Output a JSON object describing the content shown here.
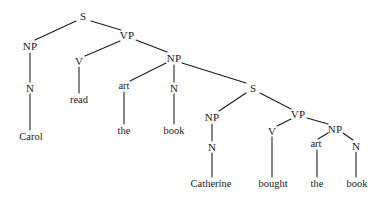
{
  "figure": {
    "kind": "syntax-tree-diagram",
    "sentence": "Carol read the book Catherine bought the book",
    "background_color": "#ffffff",
    "line_color": "#1a1a1a",
    "text_color": "#1a1a1a"
  },
  "nodes": [
    {
      "id": "s-top",
      "label": "S",
      "x": 83,
      "y": 16,
      "kind": "category"
    },
    {
      "id": "np-subj",
      "label": "NP",
      "x": 30,
      "y": 46,
      "kind": "category"
    },
    {
      "id": "n-subj",
      "label": "N",
      "x": 30,
      "y": 88,
      "kind": "category"
    },
    {
      "id": "leaf-carol",
      "label": "Carol",
      "x": 31,
      "y": 137,
      "kind": "leaf"
    },
    {
      "id": "vp-main",
      "label": "VP",
      "x": 127,
      "y": 35,
      "kind": "category"
    },
    {
      "id": "v-main",
      "label": "V",
      "x": 79,
      "y": 61,
      "kind": "category"
    },
    {
      "id": "leaf-read",
      "label": "read",
      "x": 79,
      "y": 100,
      "kind": "leaf"
    },
    {
      "id": "np-obj",
      "label": "NP",
      "x": 174,
      "y": 58,
      "kind": "category"
    },
    {
      "id": "art-obj",
      "label": "art",
      "x": 124,
      "y": 86,
      "kind": "terminal"
    },
    {
      "id": "leaf-the-1",
      "label": "the",
      "x": 124,
      "y": 131,
      "kind": "leaf"
    },
    {
      "id": "n-obj",
      "label": "N",
      "x": 174,
      "y": 88,
      "kind": "category"
    },
    {
      "id": "leaf-book-1",
      "label": "book",
      "x": 174,
      "y": 131,
      "kind": "leaf"
    },
    {
      "id": "s-rel",
      "label": "S",
      "x": 253,
      "y": 88,
      "kind": "category"
    },
    {
      "id": "np-rel-subj",
      "label": "NP",
      "x": 212,
      "y": 117,
      "kind": "category"
    },
    {
      "id": "n-rel-subj",
      "label": "N",
      "x": 212,
      "y": 147,
      "kind": "category"
    },
    {
      "id": "leaf-cath",
      "label": "Catherine",
      "x": 211,
      "y": 184,
      "kind": "leaf"
    },
    {
      "id": "vp-rel",
      "label": "VP",
      "x": 298,
      "y": 114,
      "kind": "category"
    },
    {
      "id": "v-rel",
      "label": "V",
      "x": 272,
      "y": 131,
      "kind": "category"
    },
    {
      "id": "leaf-bought",
      "label": "bought",
      "x": 273,
      "y": 184,
      "kind": "leaf"
    },
    {
      "id": "np-rel-obj",
      "label": "NP",
      "x": 335,
      "y": 129,
      "kind": "category"
    },
    {
      "id": "art-rel",
      "label": "art",
      "x": 316,
      "y": 144,
      "kind": "terminal"
    },
    {
      "id": "leaf-the-2",
      "label": "the",
      "x": 317,
      "y": 184,
      "kind": "leaf"
    },
    {
      "id": "n-rel-obj",
      "label": "N",
      "x": 356,
      "y": 146,
      "kind": "category"
    },
    {
      "id": "leaf-book-2",
      "label": "book",
      "x": 357,
      "y": 184,
      "kind": "leaf"
    }
  ],
  "edges": [
    {
      "id": "e-s-np",
      "from": "s-top",
      "to": "np-subj",
      "x1": 76,
      "y1": 21,
      "x2": 35,
      "y2": 40
    },
    {
      "id": "e-s-vp",
      "from": "s-top",
      "to": "vp-main",
      "x1": 91,
      "y1": 21,
      "x2": 121,
      "y2": 30
    },
    {
      "id": "e-np-n",
      "from": "np-subj",
      "to": "n-subj",
      "x1": 30,
      "y1": 53,
      "x2": 30,
      "y2": 82
    },
    {
      "id": "e-n-carol",
      "from": "n-subj",
      "to": "leaf-carol",
      "x1": 30,
      "y1": 94,
      "x2": 30,
      "y2": 130
    },
    {
      "id": "e-vp-v",
      "from": "vp-main",
      "to": "v-main",
      "x1": 120,
      "y1": 41,
      "x2": 85,
      "y2": 56
    },
    {
      "id": "e-vp-np",
      "from": "vp-main",
      "to": "np-obj",
      "x1": 136,
      "y1": 40,
      "x2": 167,
      "y2": 52
    },
    {
      "id": "e-v-read",
      "from": "v-main",
      "to": "leaf-read",
      "x1": 79,
      "y1": 67,
      "x2": 79,
      "y2": 93
    },
    {
      "id": "e-np-art",
      "from": "np-obj",
      "to": "art-obj",
      "x1": 166,
      "y1": 63,
      "x2": 130,
      "y2": 81
    },
    {
      "id": "e-art-the1",
      "from": "art-obj",
      "to": "leaf-the-1",
      "x1": 124,
      "y1": 92,
      "x2": 124,
      "y2": 124
    },
    {
      "id": "e-np-nobj",
      "from": "np-obj",
      "to": "n-obj",
      "x1": 174,
      "y1": 65,
      "x2": 174,
      "y2": 82
    },
    {
      "id": "e-nobj-book1",
      "from": "n-obj",
      "to": "leaf-book-1",
      "x1": 174,
      "y1": 94,
      "x2": 174,
      "y2": 124
    },
    {
      "id": "e-np-srel",
      "from": "np-obj",
      "to": "s-rel",
      "x1": 182,
      "y1": 63,
      "x2": 246,
      "y2": 83
    },
    {
      "id": "e-srel-np",
      "from": "s-rel",
      "to": "np-rel-subj",
      "x1": 246,
      "y1": 93,
      "x2": 219,
      "y2": 111
    },
    {
      "id": "e-srel-vp",
      "from": "s-rel",
      "to": "vp-rel",
      "x1": 260,
      "y1": 93,
      "x2": 291,
      "y2": 109
    },
    {
      "id": "e-nprel-n",
      "from": "np-rel-subj",
      "to": "n-rel-subj",
      "x1": 212,
      "y1": 124,
      "x2": 212,
      "y2": 141
    },
    {
      "id": "e-nrel-cath",
      "from": "n-rel-subj",
      "to": "leaf-cath",
      "x1": 212,
      "y1": 153,
      "x2": 212,
      "y2": 177
    },
    {
      "id": "e-vprel-v",
      "from": "vp-rel",
      "to": "v-rel",
      "x1": 291,
      "y1": 119,
      "x2": 277,
      "y2": 126
    },
    {
      "id": "e-vprel-np",
      "from": "vp-rel",
      "to": "np-rel-obj",
      "x1": 307,
      "y1": 118,
      "x2": 328,
      "y2": 124
    },
    {
      "id": "e-vrel-bought",
      "from": "v-rel",
      "to": "leaf-bought",
      "x1": 272,
      "y1": 137,
      "x2": 272,
      "y2": 177
    },
    {
      "id": "e-nprel-art",
      "from": "np-rel-obj",
      "to": "art-rel",
      "x1": 328,
      "y1": 133,
      "x2": 318,
      "y2": 139
    },
    {
      "id": "e-art-the2",
      "from": "art-rel",
      "to": "leaf-the-2",
      "x1": 317,
      "y1": 150,
      "x2": 317,
      "y2": 177
    },
    {
      "id": "e-nprel-nobj",
      "from": "np-rel-obj",
      "to": "n-rel-obj",
      "x1": 343,
      "y1": 133,
      "x2": 353,
      "y2": 140
    },
    {
      "id": "e-nrelobj-bk2",
      "from": "n-rel-obj",
      "to": "leaf-book-2",
      "x1": 356,
      "y1": 152,
      "x2": 356,
      "y2": 177
    }
  ]
}
